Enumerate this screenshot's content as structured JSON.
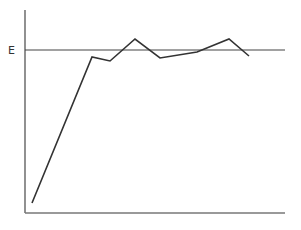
{
  "chart_data": {
    "type": "line",
    "title": "",
    "xlabel": "",
    "ylabel": "",
    "reference_line": {
      "label": "E",
      "y_px": 50
    },
    "points_px": [
      [
        32,
        203
      ],
      [
        92,
        57
      ],
      [
        110,
        61
      ],
      [
        135,
        39
      ],
      [
        160,
        58
      ],
      [
        197,
        52
      ],
      [
        229,
        39
      ],
      [
        249,
        56
      ]
    ],
    "x": [
      1,
      2,
      3,
      4,
      5,
      6,
      7,
      8
    ],
    "values": [
      0.07,
      0.96,
      0.94,
      1.07,
      0.95,
      0.99,
      1.07,
      0.96
    ],
    "grid": false,
    "legend": null,
    "line_color": "#333333",
    "axis_color": "#555555"
  },
  "labels": {
    "reference": "E"
  }
}
